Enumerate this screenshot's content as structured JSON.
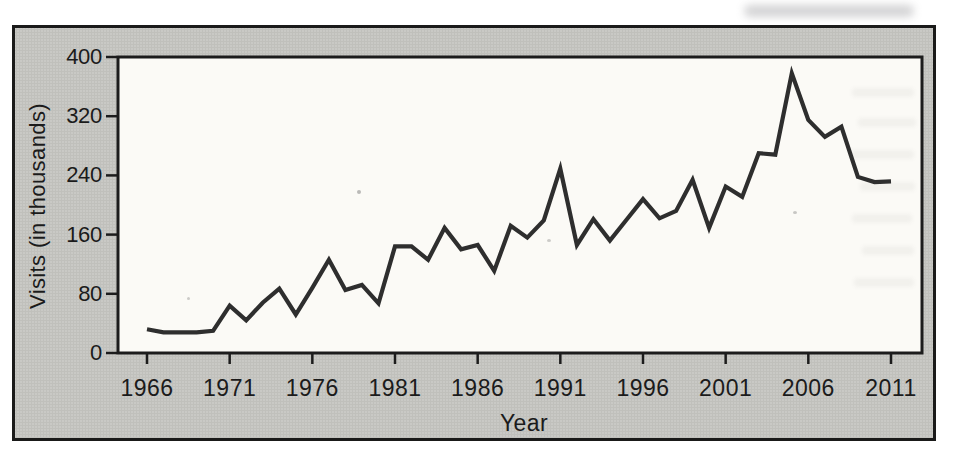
{
  "figure": {
    "background": "#c9c9c5",
    "frame_color": "#1a1a19",
    "plot_background": "#fbfaf6",
    "axis_color": "#1c1c1c",
    "text_color": "#1b1b1b"
  },
  "chart_data": {
    "type": "line",
    "title": "",
    "xlabel": "Year",
    "ylabel": "Visits (in thousands)",
    "x_ticks": [
      1966,
      1971,
      1976,
      1981,
      1986,
      1991,
      1996,
      2001,
      2006,
      2011
    ],
    "y_ticks": [
      0,
      80,
      160,
      240,
      320,
      400
    ],
    "xlim": [
      1964.3,
      2012.9
    ],
    "ylim": [
      0,
      400
    ],
    "grid": false,
    "legend_position": "none",
    "line_color": "#2e2e2e",
    "series": [
      {
        "name": "Visits",
        "x": [
          1966,
          1967,
          1968,
          1969,
          1970,
          1971,
          1972,
          1973,
          1974,
          1975,
          1976,
          1977,
          1978,
          1979,
          1980,
          1981,
          1982,
          1983,
          1984,
          1985,
          1986,
          1987,
          1988,
          1989,
          1990,
          1991,
          1992,
          1993,
          1994,
          1995,
          1996,
          1997,
          1998,
          1999,
          2000,
          2001,
          2002,
          2003,
          2004,
          2005,
          2006,
          2007,
          2008,
          2009,
          2010,
          2011
        ],
        "values": [
          32,
          28,
          28,
          28,
          30,
          64,
          44,
          68,
          87,
          52,
          88,
          126,
          85,
          92,
          67,
          144,
          144,
          126,
          169,
          140,
          146,
          111,
          172,
          156,
          179,
          249,
          146,
          181,
          152,
          180,
          208,
          182,
          192,
          234,
          169,
          225,
          211,
          270,
          268,
          378,
          315,
          292,
          306,
          238,
          231,
          232
        ]
      }
    ]
  }
}
